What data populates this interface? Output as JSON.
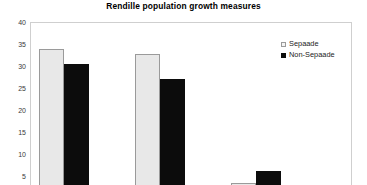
{
  "chart_data": {
    "type": "bar",
    "title": "Rendille population growth measures",
    "xlabel": "",
    "ylabel": "",
    "ylim": [
      0,
      40
    ],
    "ytick_values": [
      40,
      35,
      30,
      25,
      20,
      15,
      10,
      5
    ],
    "ytick_labels": [
      "40",
      "35",
      "30",
      "25",
      "20",
      "15",
      "10",
      "5"
    ],
    "grid": false,
    "legend_position": "top-right",
    "categories": [
      "",
      "",
      "",
      ""
    ],
    "series": [
      {
        "name": "Sepaade",
        "color": "#e8e8e8",
        "values": [
          33.8,
          32.8,
          3.5,
          0.3
        ]
      },
      {
        "name": "Non-Sepaade",
        "color": "#0c0c0c",
        "values": [
          30.4,
          27.0,
          6.1,
          0.0
        ]
      }
    ],
    "annotations": []
  },
  "legend": {
    "entries": [
      {
        "label": "Sepaade",
        "swatch": "open-square-icon"
      },
      {
        "label": "Non-Sepaade",
        "swatch": "filled-square-icon"
      }
    ]
  }
}
